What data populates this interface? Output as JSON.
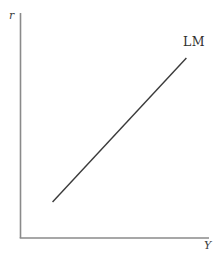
{
  "figure": {
    "ylabel": "r",
    "xlabel": "Y",
    "curve_label": "LM",
    "axis_color": "#8a8a8a",
    "curve_color": "#3a3a3a",
    "background": "#ffffff"
  },
  "chart_data": {
    "type": "line",
    "title": "",
    "xlabel": "Y",
    "ylabel": "r",
    "grid": false,
    "tick_labels": [],
    "legend": "none",
    "series": [
      {
        "name": "LM",
        "label_position": "above-right-of-line-top",
        "points_norm": [
          [
            0.17,
            0.16
          ],
          [
            0.88,
            0.8
          ]
        ]
      }
    ]
  }
}
